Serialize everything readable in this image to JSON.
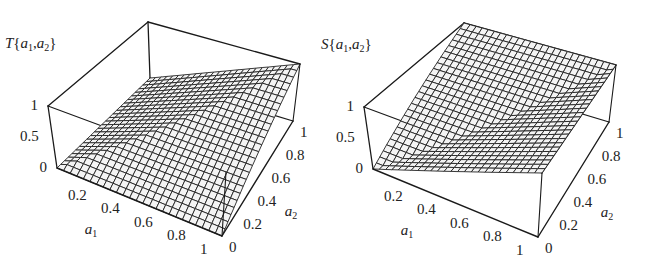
{
  "chart_data": [
    {
      "type": "surface3d",
      "title": "",
      "zlabel": "T{a1,a2}",
      "xlabel": "a1",
      "ylabel": "a2",
      "function": "min(a1,a2)",
      "description": "t-norm surface: zero along a1=0 and a2=0 edges, rises to 1 at (1,1) with a crease along the diagonal",
      "x_ticks": [
        "0.2",
        "0.4",
        "0.6",
        "0.8",
        "1"
      ],
      "y_ticks": [
        "0",
        "0.2",
        "0.4",
        "0.6",
        "0.8",
        "1"
      ],
      "z_ticks": [
        "0",
        "0.5",
        "1"
      ],
      "xlim": [
        0,
        1
      ],
      "ylim": [
        0,
        1
      ],
      "zlim": [
        0,
        1
      ],
      "grid_n": 25,
      "sample_points": [
        {
          "a1": 0,
          "a2": 0,
          "z": 0
        },
        {
          "a1": 1,
          "a2": 0,
          "z": 0
        },
        {
          "a1": 0,
          "a2": 1,
          "z": 0
        },
        {
          "a1": 1,
          "a2": 1,
          "z": 1
        },
        {
          "a1": 0.5,
          "a2": 0.5,
          "z": 0.5
        }
      ]
    },
    {
      "type": "surface3d",
      "title": "",
      "zlabel": "S{a1,a2}",
      "xlabel": "a1",
      "ylabel": "a2",
      "function": "max(a1,a2)",
      "description": "t-conorm surface: zero at (0,0), equals 1 along a1=1 and a2=1 edges with a crease along the diagonal",
      "x_ticks": [
        "0.2",
        "0.4",
        "0.6",
        "0.8",
        "1"
      ],
      "y_ticks": [
        "0",
        "0.2",
        "0.4",
        "0.6",
        "0.8",
        "1"
      ],
      "z_ticks": [
        "0",
        "0.5",
        "1"
      ],
      "xlim": [
        0,
        1
      ],
      "ylim": [
        0,
        1
      ],
      "zlim": [
        0,
        1
      ],
      "grid_n": 25,
      "sample_points": [
        {
          "a1": 0,
          "a2": 0,
          "z": 0
        },
        {
          "a1": 1,
          "a2": 0,
          "z": 1
        },
        {
          "a1": 0,
          "a2": 1,
          "z": 1
        },
        {
          "a1": 1,
          "a2": 1,
          "z": 1
        },
        {
          "a1": 0.5,
          "a2": 0.5,
          "z": 0.5
        }
      ]
    }
  ],
  "panels": [
    {
      "fn_letter": "T",
      "a1": "a",
      "a2": "a"
    },
    {
      "fn_letter": "S",
      "a1": "a",
      "a2": "a"
    }
  ]
}
